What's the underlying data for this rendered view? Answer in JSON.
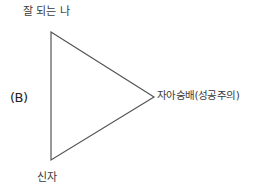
{
  "diagram": {
    "type": "triangle",
    "line_color": "#555555",
    "vertices": {
      "top": {
        "x": 51,
        "y": 32
      },
      "right": {
        "x": 154,
        "y": 97
      },
      "bottom": {
        "x": 51,
        "y": 160
      }
    },
    "labels": {
      "top": "잘 되는 나",
      "left": "(B)",
      "right": "자아숭배(성공주의)",
      "bottom": "신자"
    }
  }
}
